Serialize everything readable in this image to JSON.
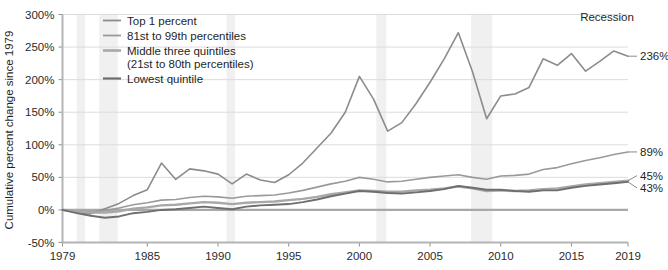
{
  "chart_data": {
    "type": "line",
    "title": "",
    "subtitle": "",
    "xlabel": "",
    "ylabel": "Cumulative percent change since 1979",
    "xlim": [
      1979,
      2019
    ],
    "ylim": [
      -50,
      300
    ],
    "grid": true,
    "legend_position": "top-left-inside",
    "yticks": [
      -50,
      0,
      50,
      100,
      150,
      200,
      250,
      300
    ],
    "ytick_labels": [
      "-50%",
      "0%",
      "50%",
      "100%",
      "150%",
      "200%",
      "250%",
      "300%"
    ],
    "xticks": [
      1979,
      1985,
      1990,
      1995,
      2000,
      2005,
      2010,
      2015,
      2019
    ],
    "xtick_labels": [
      "1979",
      "1985",
      "1990",
      "1995",
      "2000",
      "2005",
      "2010",
      "2015",
      "2019"
    ],
    "annotations": [
      {
        "text": "Recession",
        "x": 2010.2,
        "y": 292
      }
    ],
    "recession_bands": [
      {
        "start": 1980.0,
        "end": 1980.6
      },
      {
        "start": 1981.6,
        "end": 1982.9
      },
      {
        "start": 1990.6,
        "end": 1991.2
      },
      {
        "start": 2001.2,
        "end": 2001.9
      },
      {
        "start": 2007.9,
        "end": 2009.4
      }
    ],
    "x": [
      1979,
      1980,
      1981,
      1982,
      1983,
      1984,
      1985,
      1986,
      1987,
      1988,
      1989,
      1990,
      1991,
      1992,
      1993,
      1994,
      1995,
      1996,
      1997,
      1998,
      1999,
      2000,
      2001,
      2002,
      2003,
      2004,
      2005,
      2006,
      2007,
      2008,
      2009,
      2010,
      2011,
      2012,
      2013,
      2014,
      2015,
      2016,
      2017,
      2018,
      2019
    ],
    "series": [
      {
        "name": "Top 1 percent",
        "color": "#8c8c8c",
        "width": 1.6,
        "end_label": "236%",
        "values": [
          0,
          -4,
          -6,
          2,
          10,
          22,
          31,
          72,
          47,
          63,
          60,
          55,
          40,
          55,
          46,
          42,
          54,
          72,
          95,
          118,
          150,
          205,
          170,
          121,
          134,
          163,
          196,
          232,
          272,
          212,
          140,
          175,
          178,
          188,
          232,
          222,
          240,
          213,
          228,
          244,
          236
        ]
      },
      {
        "name": "81st to 99th percentiles",
        "color": "#9a9a9a",
        "width": 1.6,
        "end_label": "89%",
        "values": [
          0,
          -2,
          -3,
          -1,
          3,
          8,
          11,
          15,
          16,
          19,
          21,
          20,
          18,
          21,
          22,
          23,
          26,
          30,
          35,
          40,
          44,
          50,
          47,
          43,
          44,
          47,
          50,
          52,
          54,
          50,
          47,
          52,
          53,
          55,
          62,
          65,
          71,
          76,
          80,
          85,
          89
        ]
      },
      {
        "name": "Middle three quintiles (21st to 80th percentiles)",
        "color": "#a8a8a8",
        "width": 2.4,
        "end_label": "45%",
        "values": [
          0,
          -2,
          -4,
          -4,
          -2,
          2,
          4,
          7,
          8,
          10,
          12,
          11,
          9,
          11,
          12,
          13,
          15,
          17,
          20,
          24,
          27,
          30,
          29,
          28,
          28,
          30,
          31,
          33,
          36,
          33,
          29,
          30,
          29,
          30,
          32,
          33,
          36,
          39,
          41,
          43,
          45
        ]
      },
      {
        "name": "Lowest quintile",
        "color": "#6e6e6e",
        "width": 1.9,
        "end_label": "43%",
        "values": [
          0,
          -5,
          -9,
          -12,
          -10,
          -5,
          -3,
          0,
          1,
          3,
          5,
          3,
          1,
          5,
          7,
          8,
          9,
          12,
          16,
          21,
          25,
          29,
          28,
          26,
          25,
          27,
          29,
          32,
          37,
          34,
          31,
          31,
          29,
          28,
          30,
          30,
          34,
          37,
          39,
          41,
          43
        ]
      }
    ]
  },
  "legend": {
    "items": [
      {
        "label": "Top 1 percent",
        "label2": ""
      },
      {
        "label": "81st to 99th percentiles",
        "label2": ""
      },
      {
        "label": "Middle three quintiles",
        "label2": "(21st to 80th percentiles)"
      },
      {
        "label": "Lowest quintile",
        "label2": ""
      }
    ]
  },
  "axis": {
    "y_title": "Cumulative percent change since 1979"
  },
  "end_labels": {
    "top1": "236%",
    "p81_99": "89%",
    "middle": "45%",
    "lowest": "43%"
  },
  "annotation": {
    "recession": "Recession"
  }
}
